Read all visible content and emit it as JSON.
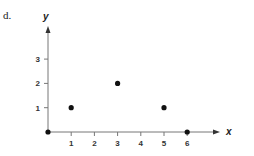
{
  "panel_label": "d.",
  "chart_data": {
    "type": "scatter",
    "title": "",
    "xlabel": "x",
    "ylabel": "y",
    "xlim": [
      0,
      6
    ],
    "ylim": [
      0,
      3
    ],
    "x_ticks": [
      "1",
      "2",
      "3",
      "4",
      "5",
      "6"
    ],
    "y_ticks": [
      "1",
      "2",
      "3"
    ],
    "grid": false,
    "legend": null,
    "points": [
      {
        "x": 0,
        "y": 0
      },
      {
        "x": 1,
        "y": 1
      },
      {
        "x": 3,
        "y": 2
      },
      {
        "x": 5,
        "y": 1
      },
      {
        "x": 6,
        "y": 0
      }
    ]
  },
  "colors": {
    "axis": "#777777",
    "point": "#111111"
  }
}
